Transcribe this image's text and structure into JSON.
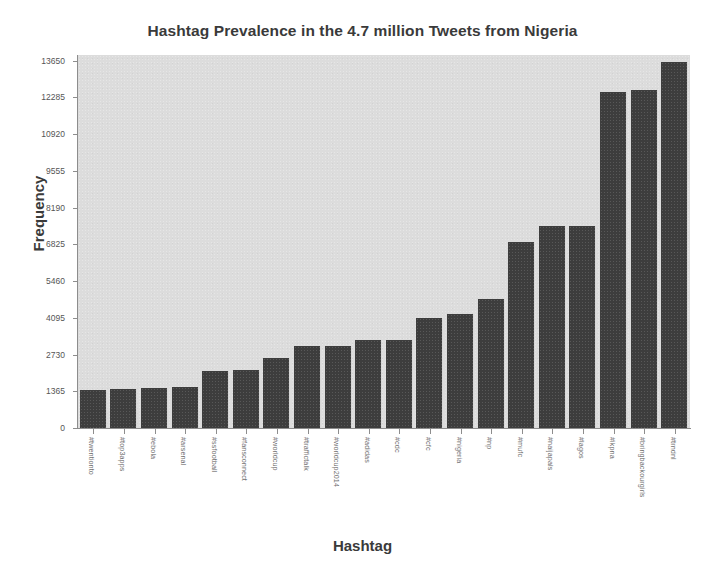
{
  "chart_data": {
    "type": "bar",
    "title": "Hashtag Prevalence in the 4.7 million Tweets from Nigeria",
    "xlabel": "Hashtag",
    "ylabel": "Frequency",
    "categories": [
      "#twentionto",
      "#top3apps",
      "#ebola",
      "#arsenal",
      "#ssfootball",
      "#fansconnect",
      "#worldcup",
      "#traffictalk",
      "#worldcup2014",
      "#adidas",
      "#cdc",
      "#cfc",
      "#nigeria",
      "#np",
      "#mufc",
      "#naijapals",
      "#lagos",
      "#ikpna",
      "#bringbackourgirls",
      "#trndnl"
    ],
    "values": [
      1430,
      1450,
      1480,
      1530,
      2130,
      2150,
      2620,
      3050,
      3050,
      3280,
      3280,
      4100,
      4230,
      4780,
      6900,
      7500,
      7500,
      12500,
      12550,
      13600
    ],
    "ytick_labels": [
      "0",
      "1365",
      "2730",
      "4095",
      "5460",
      "6825",
      "8190",
      "9555",
      "10920",
      "12285",
      "13650"
    ],
    "ytick_values": [
      0,
      1365,
      2730,
      4095,
      5460,
      6825,
      8190,
      9555,
      10920,
      12285,
      13650
    ],
    "ylim": [
      0,
      13860
    ],
    "grid": false,
    "legend": null,
    "bar_color": "#3d3d3d",
    "plot_background": "#dcdcdc",
    "figure_background": "#ffffff",
    "text_color": "#3a3a3a"
  }
}
